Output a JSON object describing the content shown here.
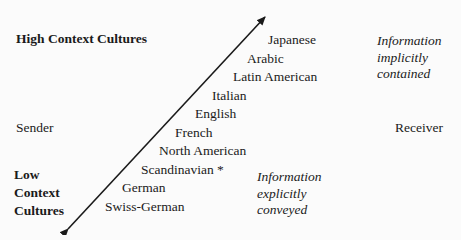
{
  "diagram": {
    "high_context_label": "High Context Cultures",
    "low_context_label": [
      "Low",
      "Context",
      "Cultures"
    ],
    "sender_label": "Sender",
    "receiver_label": "Receiver",
    "implicit_note": [
      "Information",
      "implicitly",
      "contained"
    ],
    "explicit_note": [
      "Information",
      "explicitly",
      "conveyed"
    ],
    "cultures": [
      "Japanese",
      "Arabic",
      "Latin American",
      "Italian",
      "English",
      "French",
      "North American",
      "Scandinavian *",
      "German",
      "Swiss-German"
    ],
    "arrow": {
      "style": "double-headed diagonal",
      "color": "#1a1a1a"
    }
  }
}
